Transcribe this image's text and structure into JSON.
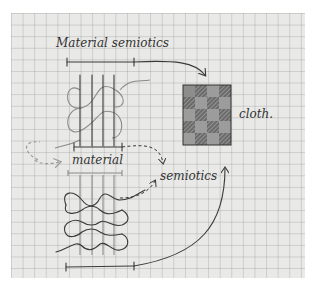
{
  "diagram": {
    "title_label": "Material semiotics",
    "labels": {
      "cloth": "cloth.",
      "material": "material",
      "semiotics": "semiotics"
    },
    "nodes": [
      {
        "id": "woven-sketch-top",
        "description": "vertical warp threads with looping weft (faded)"
      },
      {
        "id": "cloth-grid",
        "description": "checkered cloth, 4 columns x 5 rows, shaded and hatched squares"
      },
      {
        "id": "knit-sketch-bottom",
        "description": "looping knit rows"
      }
    ],
    "edges": [
      {
        "from": "top-bracket",
        "to": "cloth-grid",
        "style": "solid arrow"
      },
      {
        "from": "top-bracket",
        "to": "semiotics",
        "style": "dashed arrow"
      },
      {
        "from": "material",
        "to": "material",
        "style": "faint dashed loop arrow"
      },
      {
        "from": "knit-sketch-bottom",
        "to": "semiotics",
        "style": "dashed arrow"
      },
      {
        "from": "bottom-bracket",
        "to": "cloth-grid",
        "style": "solid arrow"
      }
    ],
    "colors": {
      "paper": "#e9e9e7",
      "grid": "#969696",
      "ink": "#3a3a3a",
      "dark_square": "#555555",
      "light_square": "#9c9c9c"
    }
  }
}
